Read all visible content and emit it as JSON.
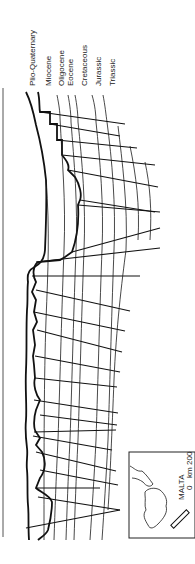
{
  "figure": {
    "type": "geological-cross-section",
    "orientation": "rotated-90",
    "stratigraphy_legend": [
      {
        "key": "plio_quaternary",
        "label": "Plio-Quaternary"
      },
      {
        "key": "miocene",
        "label": "Miocene"
      },
      {
        "key": "oligocene",
        "label": "Oligocene"
      },
      {
        "key": "eocene",
        "label": "Eocene"
      },
      {
        "key": "cretaceous",
        "label": "Cretaceous"
      },
      {
        "key": "jurassic",
        "label": "Jurassic"
      },
      {
        "key": "triassic",
        "label": "Triassic"
      }
    ],
    "inset_map": {
      "location_label": "MALTA",
      "scale_start": "0",
      "scale_unit": "km",
      "scale_end": "200"
    },
    "colors": {
      "line": "#111111",
      "background": "#ffffff",
      "frame": "#555555"
    }
  }
}
